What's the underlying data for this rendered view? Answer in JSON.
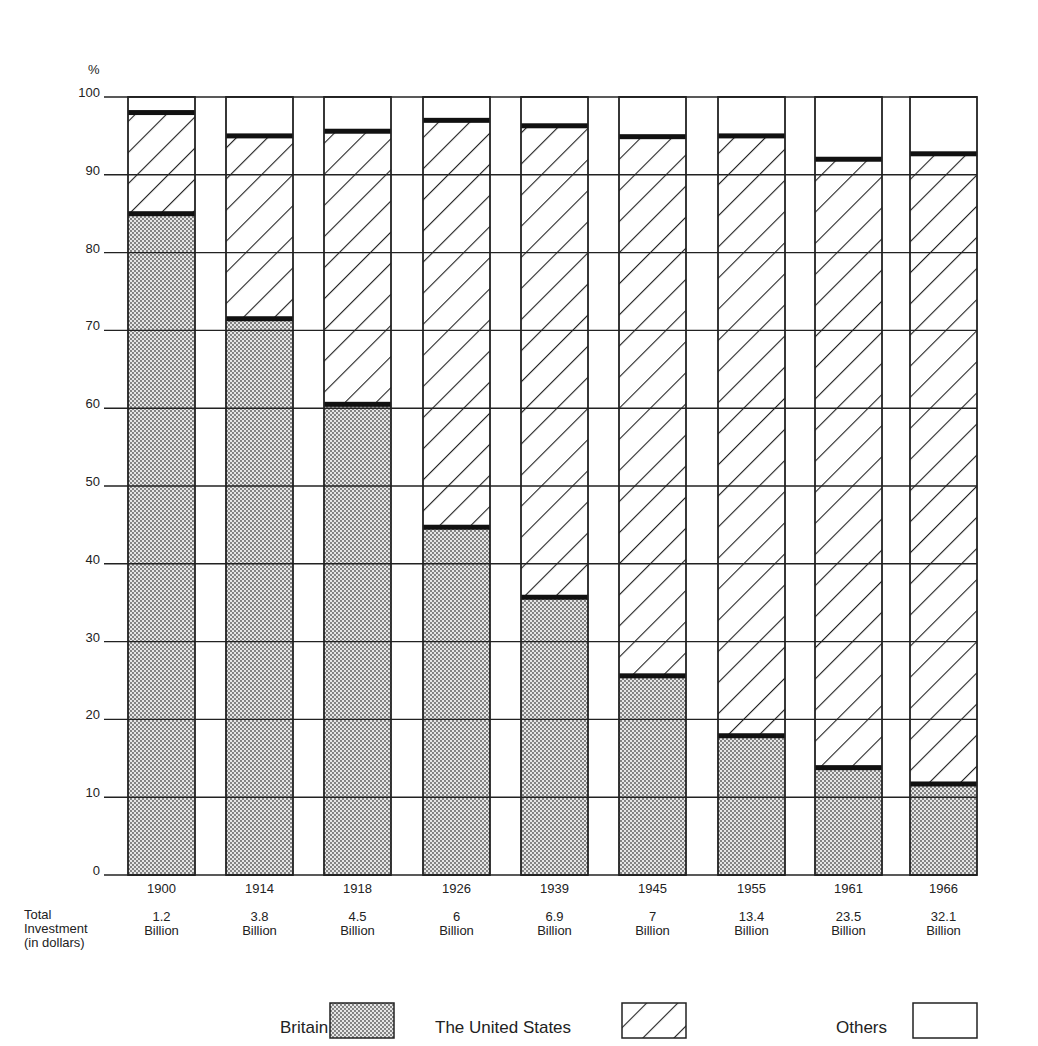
{
  "chart_data": {
    "type": "bar",
    "stacked": true,
    "percent_scale": true,
    "title": "",
    "ylabel": "%",
    "xlabel": "",
    "ylim": [
      0,
      100
    ],
    "yticks": [
      0,
      10,
      20,
      30,
      40,
      50,
      60,
      70,
      80,
      90,
      100
    ],
    "grid": true,
    "categories": [
      "1900",
      "1914",
      "1918",
      "1926",
      "1939",
      "1945",
      "1955",
      "1961",
      "1966"
    ],
    "total_investment_label": "Total Investment (in dollars)",
    "total_investment": [
      "1.2 Billion",
      "3.8 Billion",
      "4.5 Billion",
      "6 Billion",
      "6.9 Billion",
      "7 Billion",
      "13.4 Billion",
      "23.5 Billion",
      "32.1 Billion"
    ],
    "series": [
      {
        "name": "Britain",
        "pattern": "dotted",
        "values": [
          85,
          71.5,
          60.5,
          44.7,
          35.7,
          25.6,
          17.9,
          13.8,
          11.7
        ]
      },
      {
        "name": "The United States",
        "pattern": "diagonal-hatch",
        "values": [
          13,
          23.5,
          35.1,
          52.3,
          60.6,
          69.3,
          77.1,
          78.2,
          81.0
        ]
      },
      {
        "name": "Others",
        "pattern": "blank",
        "values": [
          2,
          5,
          4.4,
          3,
          3.7,
          5.1,
          5,
          8,
          7.3
        ]
      }
    ],
    "cumulative_top": {
      "Britain": [
        85,
        71.5,
        60.5,
        44.7,
        35.7,
        25.6,
        17.9,
        13.8,
        11.7
      ],
      "The United States": [
        98,
        95,
        95.6,
        97,
        96.3,
        94.9,
        95,
        92,
        92.7
      ]
    },
    "legend_position": "bottom"
  },
  "axis": {
    "unit_label": "%",
    "tick_labels": [
      "0",
      "10",
      "20",
      "30",
      "40",
      "50",
      "60",
      "70",
      "80",
      "90",
      "100"
    ]
  },
  "footer": {
    "total_label_line1": "Total",
    "total_label_line2": "Investment",
    "total_label_line3": "(in dollars)",
    "amounts": [
      "1.2",
      "3.8",
      "4.5",
      "6",
      "6.9",
      "7",
      "13.4",
      "23.5",
      "32.1"
    ],
    "unit": "Billion"
  },
  "legend": {
    "britain": "Britain",
    "us": "The United States",
    "others": "Others"
  }
}
